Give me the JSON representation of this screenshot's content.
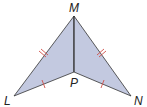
{
  "diagram": {
    "type": "geometry",
    "fill_color": "#c3c9e0",
    "stroke_color": "#333333",
    "tick_color": "#d0504a",
    "points": {
      "M": {
        "label": "M",
        "x": 74,
        "y": 16
      },
      "P": {
        "label": "P",
        "x": 74,
        "y": 72
      },
      "L": {
        "label": "L",
        "x": 14,
        "y": 96
      },
      "N": {
        "label": "N",
        "x": 131,
        "y": 96
      }
    },
    "congruent_marks": [
      {
        "segment": "LM",
        "ticks": 2
      },
      {
        "segment": "NM",
        "ticks": 2
      },
      {
        "segment": "LP",
        "ticks": 1
      },
      {
        "segment": "NP",
        "ticks": 1
      }
    ]
  }
}
